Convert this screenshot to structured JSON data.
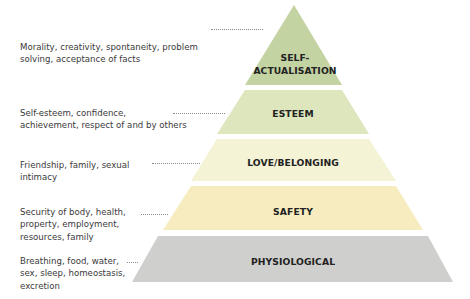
{
  "diagram": {
    "type": "pyramid",
    "title": "",
    "tiers": [
      {
        "level": 5,
        "label": "SELF-ACTUALISATION",
        "label_line1": "SELF-",
        "label_line2": "ACTUALISATION",
        "description_line1": "Morality, creativity, spontaneity, problem",
        "description_line2": "solving, acceptance of facts",
        "color": "#c3d3a2"
      },
      {
        "level": 4,
        "label": "ESTEEM",
        "description_line1": "Self-esteem, confidence,",
        "description_line2": "achievement, respect of and by others",
        "color": "#dde6bd"
      },
      {
        "level": 3,
        "label": "LOVE/BELONGING",
        "description_line1": "Friendship, family, sexual",
        "description_line2": "intimacy",
        "color": "#f4f3d6"
      },
      {
        "level": 2,
        "label": "SAFETY",
        "description_line1": "Security of body, health,",
        "description_line2": "property, employment,",
        "description_line3": "resources, family",
        "color": "#f7ecbf"
      },
      {
        "level": 1,
        "label": "PHYSIOLOGICAL",
        "description_line1": "Breathing, food, water,",
        "description_line2": "sex, sleep, homeostasis,",
        "description_line3": "excretion",
        "color": "#cfcfcd"
      }
    ]
  }
}
